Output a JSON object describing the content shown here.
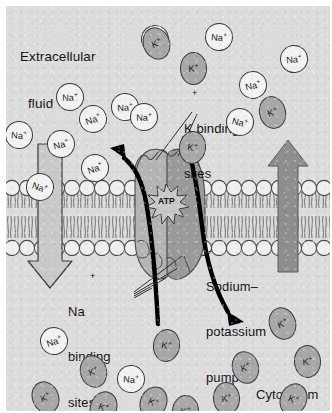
{
  "figure": {
    "background_color": "#dcdcdc",
    "frame_color": "#ffffff"
  },
  "labels": {
    "extracellular_line1": "Extracellular",
    "extracellular_line2": "fluid",
    "k_binding_line1": "K binding",
    "k_binding_line2": "sites",
    "na_binding_line1": "Na",
    "na_binding_line2": "binding",
    "na_binding_line3": "sites",
    "pump_line1": "Sodium–",
    "pump_line2": "potassium",
    "pump_line3": "pump",
    "cytoplasm": "Cytoplasm",
    "atp": "ATP",
    "plus": "+"
  },
  "ions": {
    "sodium_symbol": "Na",
    "potassium_symbol": "K",
    "charge": "+",
    "sodium_fill": "#f2f2f2",
    "potassium_fill": "#a8a8a8",
    "outline": "#3a3a3a",
    "extracellular_sodium": [
      {
        "x": 63,
        "y": 90
      },
      {
        "x": 12,
        "y": 128
      },
      {
        "x": 86,
        "y": 112
      },
      {
        "x": 54,
        "y": 137
      },
      {
        "x": 118,
        "y": 100
      },
      {
        "x": 137,
        "y": 110
      },
      {
        "x": 88,
        "y": 161
      },
      {
        "x": 33,
        "y": 180
      },
      {
        "x": 212,
        "y": 30
      },
      {
        "x": 287,
        "y": 52
      },
      {
        "x": 246,
        "y": 78
      },
      {
        "x": 233,
        "y": 115
      },
      {
        "x": 148,
        "y": 32
      }
    ],
    "extracellular_potassium": [
      {
        "x": 149,
        "y": 36
      },
      {
        "x": 186,
        "y": 61
      },
      {
        "x": 265,
        "y": 105
      },
      {
        "x": 185,
        "y": 140
      }
    ],
    "cytoplasm_sodium": [
      {
        "x": 47,
        "y": 334
      },
      {
        "x": 124,
        "y": 372
      },
      {
        "x": 199,
        "y": 419
      }
    ],
    "cytoplasm_potassium": [
      {
        "x": 86,
        "y": 364
      },
      {
        "x": 38,
        "y": 390
      },
      {
        "x": 96,
        "y": 400
      },
      {
        "x": 146,
        "y": 395
      },
      {
        "x": 275,
        "y": 316
      },
      {
        "x": 300,
        "y": 354
      },
      {
        "x": 286,
        "y": 392
      },
      {
        "x": 238,
        "y": 360
      },
      {
        "x": 219,
        "y": 391
      },
      {
        "x": 178,
        "y": 404
      },
      {
        "x": 159,
        "y": 338
      },
      {
        "x": 249,
        "y": 427
      },
      {
        "x": 303,
        "y": 427
      },
      {
        "x": 62,
        "y": 432
      },
      {
        "x": 132,
        "y": 438
      },
      {
        "x": 194,
        "y": 444
      }
    ]
  },
  "membrane": {
    "head_fill": "#efefef",
    "head_outline": "#4a4a4a",
    "tail_color": "#6b6b6b",
    "top_y": 176,
    "bottom_y": 250
  },
  "pump": {
    "fill_light": "#b4b4b4",
    "fill_dark": "#9a9a9a",
    "outline": "#4a4a4a",
    "atp_burst_fill": "#c8c8c8"
  },
  "arrows": {
    "sodium_out_direction": "down",
    "sodium_out_style": "hollow-outline",
    "sodium_out_color": "#c9c9c9",
    "potassium_in_direction": "up",
    "potassium_in_style": "solid",
    "potassium_in_color": "#8e8e8e",
    "curved_color": "#000000"
  }
}
